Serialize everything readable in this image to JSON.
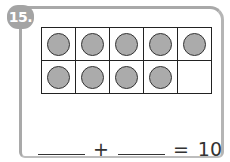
{
  "problem": {
    "number": "15.",
    "ten_frame": {
      "rows": 2,
      "columns": 5,
      "filled": [
        true,
        true,
        true,
        true,
        true,
        true,
        true,
        true,
        true,
        false
      ],
      "counter_color": "#ababab"
    },
    "equation": {
      "blank1": "",
      "plus": "+",
      "blank2": "",
      "equals": "=",
      "total": "10"
    }
  }
}
